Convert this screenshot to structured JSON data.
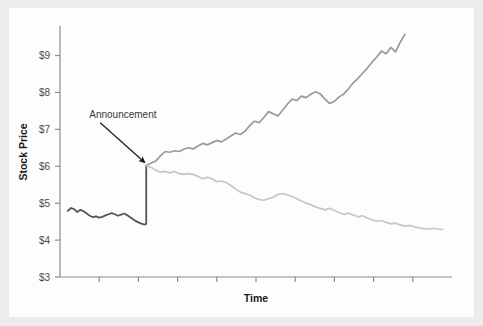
{
  "figure": {
    "background_color": "#ececec",
    "plate_color": "#fdfdfd",
    "width": 483,
    "height": 326
  },
  "chart_data": {
    "type": "line",
    "title": "",
    "subtitle": "",
    "xlabel": "Time",
    "ylabel": "Stock Price",
    "grid": false,
    "legend_position": "none",
    "ylim": [
      3,
      9.8
    ],
    "xlim": [
      0,
      100
    ],
    "y_ticks": [
      3,
      4,
      5,
      6,
      7,
      8,
      9
    ],
    "y_tick_labels": [
      "$3",
      "$4",
      "$5",
      "$6",
      "$7",
      "$8",
      "$9"
    ],
    "x_ticks": [
      10,
      20,
      30,
      40,
      50,
      60,
      70,
      80,
      90
    ],
    "x_tick_labels": [
      "",
      "",
      "",
      "",
      "",
      "",
      "",
      "",
      ""
    ],
    "annotations": [
      {
        "text": "Announcement",
        "x": 22,
        "y": 7.15,
        "arrow_to_x": 22,
        "arrow_to_y": 6.02,
        "color": "#3a3a3a"
      }
    ],
    "series": [
      {
        "name": "pre-announcement",
        "color": "#555555",
        "width": 1.8,
        "x": [
          2.0,
          2.8,
          3.6,
          4.4,
          5.2,
          6.0,
          6.8,
          7.6,
          8.4,
          9.2,
          10.0,
          10.8,
          11.6,
          12.4,
          13.2,
          14.0,
          14.8,
          15.6,
          16.4,
          17.2,
          18.0,
          18.8,
          19.6,
          20.4,
          21.2,
          21.8,
          22.0,
          22.0
        ],
        "values": [
          4.79,
          4.87,
          4.84,
          4.76,
          4.82,
          4.78,
          4.72,
          4.66,
          4.62,
          4.64,
          4.61,
          4.63,
          4.67,
          4.7,
          4.73,
          4.7,
          4.66,
          4.69,
          4.72,
          4.67,
          4.61,
          4.55,
          4.5,
          4.46,
          4.43,
          4.42,
          4.45,
          6.02
        ]
      },
      {
        "name": "good-outcome",
        "color": "#9a9a9a",
        "width": 1.7,
        "x": [
          22.0,
          23.2,
          24.4,
          25.6,
          26.8,
          28.0,
          29.2,
          30.4,
          31.6,
          32.8,
          34.0,
          35.2,
          36.4,
          37.6,
          38.8,
          40.0,
          41.2,
          42.4,
          43.6,
          44.8,
          46.0,
          47.2,
          48.4,
          49.6,
          50.8,
          52.0,
          53.2,
          54.4,
          55.6,
          56.8,
          58.0,
          59.2,
          60.4,
          61.6,
          62.8,
          64.0,
          65.2,
          66.4,
          67.6,
          68.8,
          70.0,
          71.2,
          72.4,
          73.6,
          74.8,
          76.0,
          77.2,
          78.4,
          79.6,
          80.8,
          82.0,
          83.2,
          84.4,
          85.6,
          86.8,
          88.0
        ],
        "values": [
          6.02,
          6.08,
          6.14,
          6.28,
          6.4,
          6.38,
          6.42,
          6.4,
          6.46,
          6.5,
          6.47,
          6.55,
          6.62,
          6.58,
          6.64,
          6.7,
          6.66,
          6.74,
          6.82,
          6.9,
          6.86,
          6.95,
          7.1,
          7.22,
          7.18,
          7.32,
          7.48,
          7.42,
          7.36,
          7.52,
          7.68,
          7.82,
          7.78,
          7.9,
          7.86,
          7.95,
          8.02,
          7.96,
          7.82,
          7.7,
          7.76,
          7.88,
          7.96,
          8.1,
          8.26,
          8.38,
          8.52,
          8.66,
          8.82,
          8.96,
          9.12,
          9.05,
          9.22,
          9.1,
          9.36,
          9.58
        ]
      },
      {
        "name": "bad-outcome",
        "color": "#c6c6c6",
        "width": 1.7,
        "x": [
          22.0,
          23.2,
          24.4,
          25.6,
          26.8,
          28.0,
          29.2,
          30.4,
          31.6,
          32.8,
          34.0,
          35.2,
          36.4,
          37.6,
          38.8,
          40.0,
          41.2,
          42.4,
          43.6,
          44.8,
          46.0,
          47.2,
          48.4,
          49.6,
          50.8,
          52.0,
          53.2,
          54.4,
          55.6,
          56.8,
          58.0,
          59.2,
          60.4,
          61.6,
          62.8,
          64.0,
          65.2,
          66.4,
          67.6,
          68.8,
          70.0,
          71.2,
          72.4,
          73.6,
          74.8,
          76.0,
          77.2,
          78.4,
          79.6,
          80.8,
          82.0,
          83.2,
          84.4,
          85.6,
          86.8,
          88.0,
          89.2,
          90.4,
          91.6,
          92.8,
          94.0,
          95.2,
          96.4,
          97.6
        ],
        "values": [
          6.02,
          5.97,
          5.9,
          5.84,
          5.86,
          5.82,
          5.86,
          5.8,
          5.78,
          5.8,
          5.78,
          5.72,
          5.66,
          5.7,
          5.66,
          5.58,
          5.6,
          5.56,
          5.48,
          5.38,
          5.3,
          5.26,
          5.22,
          5.14,
          5.1,
          5.08,
          5.12,
          5.16,
          5.24,
          5.26,
          5.22,
          5.18,
          5.12,
          5.06,
          5.0,
          4.96,
          4.9,
          4.86,
          4.82,
          4.86,
          4.8,
          4.74,
          4.7,
          4.73,
          4.68,
          4.63,
          4.66,
          4.6,
          4.55,
          4.51,
          4.53,
          4.48,
          4.44,
          4.46,
          4.41,
          4.38,
          4.4,
          4.36,
          4.33,
          4.31,
          4.3,
          4.32,
          4.3,
          4.29
        ]
      }
    ]
  }
}
